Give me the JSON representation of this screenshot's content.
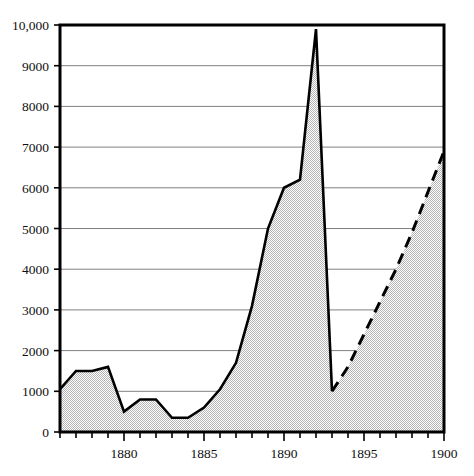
{
  "chart_data": {
    "type": "area",
    "title": "",
    "subtitle": "",
    "xlabel": "",
    "ylabel": "",
    "xlim": [
      1876,
      1900
    ],
    "ylim": [
      0,
      10000
    ],
    "grid": true,
    "legend_position": "none",
    "y_ticks": [
      0,
      1000,
      2000,
      3000,
      4000,
      5000,
      6000,
      7000,
      8000,
      9000,
      10000
    ],
    "y_tick_labels": [
      "0",
      "1000",
      "2000",
      "3000",
      "4000",
      "5000",
      "6000",
      "7000",
      "8000",
      "9000",
      "10,000"
    ],
    "x_ticks": [
      1876,
      1877,
      1878,
      1879,
      1880,
      1881,
      1882,
      1883,
      1884,
      1885,
      1886,
      1887,
      1888,
      1889,
      1890,
      1891,
      1892,
      1893,
      1894,
      1895,
      1896,
      1897,
      1898,
      1899,
      1900
    ],
    "x_tick_labels": [
      "",
      "",
      "",
      "",
      "1880",
      "",
      "",
      "",
      "",
      "1885",
      "",
      "",
      "",
      "",
      "1890",
      "",
      "",
      "",
      "",
      "1895",
      "",
      "",
      "",
      "",
      "1900"
    ],
    "x_major_ticks": [
      1880,
      1885,
      1890,
      1895,
      1900
    ],
    "series": [
      {
        "name": "observed",
        "style": "solid",
        "filled": true,
        "x": [
          1876,
          1877,
          1878,
          1879,
          1880,
          1881,
          1882,
          1883,
          1884,
          1885,
          1886,
          1887,
          1888,
          1889,
          1890,
          1891,
          1892,
          1893
        ],
        "values": [
          1050,
          1500,
          1500,
          1600,
          500,
          800,
          800,
          350,
          350,
          600,
          1050,
          1700,
          3100,
          5000,
          6000,
          6200,
          9900,
          1000
        ]
      },
      {
        "name": "projected",
        "style": "dashed",
        "filled": true,
        "x": [
          1893,
          1894,
          1895,
          1896,
          1897,
          1898,
          1899,
          1900
        ],
        "values": [
          1000,
          1600,
          2400,
          3200,
          4000,
          4900,
          5900,
          6900
        ]
      }
    ],
    "colors": {
      "line": "#000000",
      "fill": "#d8d8d8",
      "grid": "#808080",
      "frame": "#000000",
      "text": "#101010"
    }
  }
}
